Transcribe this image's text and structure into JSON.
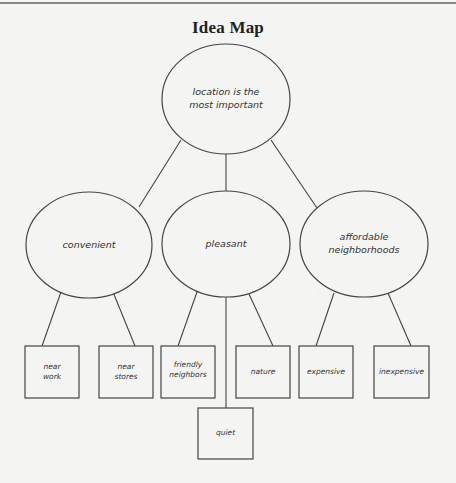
{
  "title": "Idea Map",
  "colors": {
    "background": "#f4f4f3",
    "stroke": "#444444",
    "text": "#333333",
    "rule": "#8a8a8a"
  },
  "root": {
    "label": "location is the\nmost important"
  },
  "categories": [
    {
      "label": "convenient",
      "children": [
        {
          "label": "near\nwork"
        },
        {
          "label": "near\nstores"
        }
      ]
    },
    {
      "label": "pleasant",
      "children": [
        {
          "label": "friendly\nneighbors"
        },
        {
          "label": "quiet"
        },
        {
          "label": "nature"
        }
      ]
    },
    {
      "label": "affordable\nneighborhoods",
      "children": [
        {
          "label": "expensive"
        },
        {
          "label": "inexpensive"
        }
      ]
    }
  ]
}
